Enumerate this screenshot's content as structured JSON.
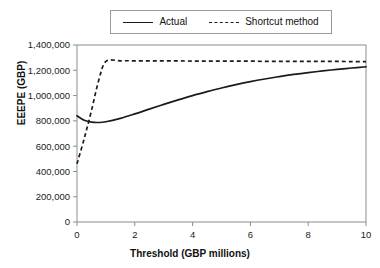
{
  "chart_data": {
    "type": "line",
    "title": "",
    "xlabel": "Threshold (GBP millions)",
    "ylabel": "EEEPE (GBP)",
    "xlim": [
      0,
      10
    ],
    "ylim": [
      0,
      1400000
    ],
    "xticks": [
      "0",
      "2",
      "4",
      "6",
      "8",
      "10"
    ],
    "xtick_values": [
      0,
      2,
      4,
      6,
      8,
      10
    ],
    "yticks": [
      "0",
      "200,000",
      "400,000",
      "600,000",
      "800,000",
      "1,000,000",
      "1,200,000",
      "1,400,000"
    ],
    "ytick_values": [
      0,
      200000,
      400000,
      600000,
      800000,
      1000000,
      1200000,
      1400000
    ],
    "grid": false,
    "legend_position": "top-center",
    "x": [
      0,
      0.25,
      0.5,
      0.75,
      1,
      1.5,
      2,
      2.5,
      3,
      3.5,
      4,
      4.5,
      5,
      5.5,
      6,
      6.5,
      7,
      7.5,
      8,
      8.5,
      9,
      9.5,
      10
    ],
    "series": [
      {
        "name": "Actual",
        "style": "solid",
        "color": "#1b1b1b",
        "values": [
          840000,
          805000,
          790000,
          787000,
          793000,
          820000,
          855000,
          893000,
          930000,
          966000,
          1000000,
          1031000,
          1060000,
          1086000,
          1110000,
          1131000,
          1150000,
          1167000,
          1182000,
          1195000,
          1207000,
          1218000,
          1228000
        ]
      },
      {
        "name": "Shortcut method",
        "style": "dashed",
        "color": "#1b1b1b",
        "values": [
          460000,
          660000,
          880000,
          1120000,
          1270000,
          1275000,
          1275000,
          1275000,
          1274000,
          1274000,
          1273000,
          1273000,
          1272000,
          1272000,
          1272000,
          1271000,
          1271000,
          1271000,
          1270000,
          1270000,
          1270000,
          1269000,
          1269000
        ]
      }
    ]
  },
  "legend": {
    "entries": [
      {
        "label": "Actual"
      },
      {
        "label": "Shortcut method"
      }
    ]
  },
  "axes": {
    "x_title": "Threshold (GBP millions)",
    "y_title": "EEEPE (GBP)"
  }
}
